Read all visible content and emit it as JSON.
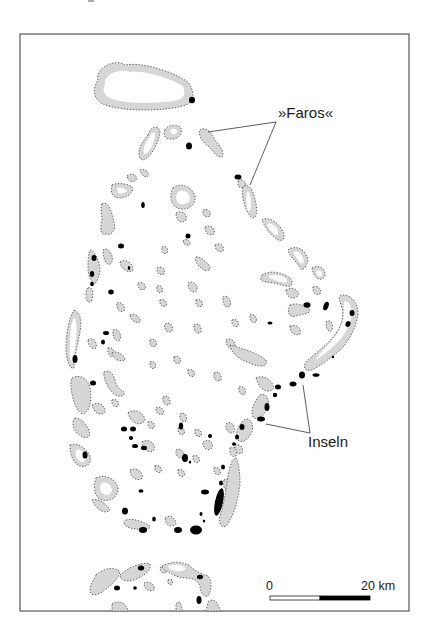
{
  "map": {
    "labels": {
      "faros": "»Faros«",
      "inseln": "Inseln"
    },
    "scale_bar": {
      "start_label": "0",
      "end_label": "20 km"
    },
    "colors": {
      "reef_fill": "#d6d6d6",
      "reef_outline": "#555555",
      "island": "#000000",
      "lagoon": "#ffffff",
      "frame": "#555555"
    },
    "frame": {
      "x": 20,
      "y": 34,
      "w": 389,
      "h": 577
    },
    "leaders": {
      "faros": [
        [
          276,
          122,
          208,
          132
        ],
        [
          276,
          122,
          250,
          185
        ]
      ],
      "inseln": [
        [
          310,
          433,
          266,
          424
        ],
        [
          310,
          433,
          303,
          385
        ]
      ]
    },
    "reefs": [
      {
        "d": "M98,80 C95,68 115,58 125,65 C140,62 170,70 188,82 C195,92 194,100 188,104 C170,112 120,112 103,104 C92,98 93,88 98,80 Z",
        "lagoon": "M105,84 C104,74 120,68 130,72 C145,70 170,78 183,86 C186,94 184,98 178,100 C160,104 122,104 110,98 C102,94 103,88 105,84 Z"
      },
      {
        "d": "M148,135 C150,126 160,124 160,133 C158,145 150,158 143,160 C136,158 138,146 148,135 Z",
        "lagoon": "M149,138 C152,131 156,131 155,137 C153,146 149,153 145,154 C142,151 144,145 149,138 Z"
      },
      {
        "d": "M165,130 C168,124 178,124 181,128 C183,136 176,140 170,139 C165,139 163,135 165,130 Z",
        "lagoon": "M170,131 C172,128 176,128 177,131 C177,134 174,135 172,134 Z"
      },
      {
        "d": "M200,130 C205,126 212,132 215,140 C220,146 225,152 222,157 C217,158 212,150 208,146 C202,142 198,135 200,130 Z"
      },
      {
        "d": "M238,180 C242,178 246,182 246,186 C244,188 240,188 238,186 Z"
      },
      {
        "d": "M244,186 C248,184 252,188 254,196 C257,205 258,215 254,218 C249,218 245,208 243,198 C242,192 242,188 244,186 Z",
        "lagoon": "M247,192 C249,191 251,196 251,203 C251,209 250,212 248,211 C246,207 246,198 247,192 Z"
      },
      {
        "d": "M127,176 C132,172 138,175 136,180 C133,183 128,182 127,176 Z"
      },
      {
        "d": "M140,170 C144,168 150,172 148,176 C146,178 142,177 140,170 Z"
      },
      {
        "d": "M112,185 C118,182 130,184 133,188 C132,195 125,198 118,198 C112,197 110,192 112,185 Z",
        "lagoon": "M117,188 C121,187 126,189 127,191 C125,193 121,194 118,193 Z"
      },
      {
        "d": "M102,204 C108,200 112,212 114,222 C116,230 112,236 106,234 C100,236 100,228 102,220 C102,214 100,208 102,204 Z"
      },
      {
        "d": "M173,188 C180,182 192,186 195,196 C196,206 188,210 180,209 C172,207 168,198 173,188 Z",
        "lagoon": "M178,192 C183,189 189,192 190,198 C190,203 185,205 180,204 C176,202 175,196 178,192 Z"
      },
      {
        "d": "M176,213 C182,210 188,214 186,220 C182,224 176,222 176,213 Z"
      },
      {
        "d": "M203,210 C207,208 212,212 210,216 C206,218 202,216 203,210 Z"
      },
      {
        "d": "M205,227 C210,224 216,228 214,234 C210,236 205,234 205,227 Z"
      },
      {
        "d": "M215,245 C220,242 225,246 223,251 C219,253 215,250 215,245 Z"
      },
      {
        "d": "M183,241 C186,238 190,240 190,244 C188,246 184,246 183,241 Z"
      },
      {
        "d": "M196,257 C200,256 205,261 209,265 C212,269 208,272 204,270 C199,267 194,262 196,257 Z"
      },
      {
        "d": "M162,247 C166,245 169,249 167,253 C164,255 161,252 162,247 Z"
      },
      {
        "d": "M157,268 C161,265 166,269 164,274 C160,276 156,273 157,268 Z"
      },
      {
        "d": "M138,283 C142,281 147,285 145,289 C141,291 137,288 138,283 Z"
      },
      {
        "d": "M157,286 C160,284 164,288 162,292 C159,294 156,291 157,286 Z"
      },
      {
        "d": "M160,300 C164,298 168,302 166,306 C162,308 159,304 160,300 Z"
      },
      {
        "d": "M188,283 C192,280 198,284 197,290 C194,294 188,292 188,283 Z"
      },
      {
        "d": "M196,300 C200,298 204,302 202,306 C198,308 195,305 196,300 Z"
      },
      {
        "d": "M194,325 C198,322 202,326 201,332 C198,335 193,332 194,325 Z"
      },
      {
        "d": "M223,297 C227,294 232,300 230,306 C227,309 222,306 223,297 Z"
      },
      {
        "d": "M232,320 C236,318 240,322 238,326 C235,328 231,325 232,320 Z"
      },
      {
        "d": "M250,315 C254,313 258,318 256,322 C252,324 249,320 250,315 Z"
      },
      {
        "d": "M226,340 C230,337 236,341 235,347 C232,351 226,348 226,340 Z"
      },
      {
        "d": "M165,324 C170,321 174,326 172,331 C168,334 163,330 165,324 Z"
      },
      {
        "d": "M150,340 C154,337 158,342 156,346 C152,348 149,345 150,340 Z"
      },
      {
        "d": "M174,357 C178,354 182,359 180,363 C176,365 173,361 174,357 Z"
      },
      {
        "d": "M150,362 C154,360 157,364 155,368 C152,370 149,367 150,362 Z"
      },
      {
        "d": "M214,373 C218,370 222,374 221,380 C217,383 213,379 214,373 Z"
      },
      {
        "d": "M188,370 C192,368 196,372 194,376 C190,378 187,374 188,370 Z"
      },
      {
        "d": "M239,387 C243,385 247,390 245,394 C241,396 238,392 239,387 Z"
      },
      {
        "d": "M163,397 C167,394 171,398 170,404 C166,407 162,403 163,397 Z"
      },
      {
        "d": "M180,414 C184,411 188,416 186,421 C182,423 179,419 180,414 Z"
      },
      {
        "d": "M226,424 C230,420 236,425 234,432 C230,435 225,431 226,424 Z"
      },
      {
        "d": "M235,445 C240,443 244,448 242,453 C237,455 234,451 235,445 Z"
      },
      {
        "d": "M130,315 C134,312 142,318 140,322 C136,324 130,320 130,315 Z"
      },
      {
        "d": "M120,262 C126,258 134,264 133,270 C130,274 121,270 120,262 Z"
      },
      {
        "d": "M103,250 C108,246 114,255 112,262 C109,268 103,262 103,250 Z"
      },
      {
        "d": "M90,250 C94,250 98,258 100,268 C100,274 98,280 95,284 C91,282 88,276 88,268 C88,262 88,256 90,250 Z"
      },
      {
        "d": "M88,288 C92,286 94,292 92,300 C90,304 86,302 86,296 C86,292 86,290 88,288 Z"
      },
      {
        "d": "M74,310 C80,312 82,320 80,332 C78,344 74,356 74,368 C70,370 66,360 66,348 C66,332 70,316 74,310 Z",
        "lagoon": "M74,318 C77,320 77,330 76,340 C75,350 73,358 72,362 C70,360 69,352 70,342 C70,330 72,320 74,318 Z"
      },
      {
        "d": "M88,340 C92,336 98,342 96,348 C92,350 88,346 88,340 Z"
      },
      {
        "d": "M113,330 C118,328 122,334 120,340 C116,342 112,338 113,330 Z"
      },
      {
        "d": "M108,348 C112,346 116,352 114,356 C110,358 107,354 108,348 Z"
      },
      {
        "d": "M117,303 C121,301 126,306 124,311 C120,313 116,309 117,303 Z"
      },
      {
        "d": "M112,353 C116,350 124,354 125,360 C120,362 113,360 112,353 Z"
      },
      {
        "d": "M72,378 C80,374 88,378 90,388 C92,400 90,410 84,414 C78,414 74,404 72,394 C71,388 70,382 72,378 Z"
      },
      {
        "d": "M104,372 C108,369 114,374 115,380 C116,386 120,390 124,392 C126,396 120,398 114,394 C108,388 103,380 104,372 Z"
      },
      {
        "d": "M112,400 C116,398 120,402 118,406 C115,408 111,405 112,400 Z"
      },
      {
        "d": "M75,418 C82,418 88,426 90,434 C88,440 82,438 76,432 C72,426 72,420 75,418 Z"
      },
      {
        "d": "M70,445 C78,442 86,448 90,456 C92,464 86,468 80,466 C74,464 70,456 70,445 Z",
        "lagoon": "M76,450 C80,448 84,452 86,458 C86,462 82,463 79,461 C76,458 75,454 76,450 Z"
      },
      {
        "d": "M92,405 C98,401 106,405 105,412 C102,416 94,414 92,405 Z"
      },
      {
        "d": "M128,413 C134,408 144,412 145,420 C142,426 132,426 128,413 Z"
      },
      {
        "d": "M142,442 C148,438 156,443 154,450 C150,454 142,450 142,442 Z"
      },
      {
        "d": "M148,422 C152,420 156,424 154,428 C150,430 147,426 148,422 Z"
      },
      {
        "d": "M156,408 C160,405 165,410 163,414 C159,416 155,412 156,408 Z"
      },
      {
        "d": "M178,428 C182,426 186,430 184,434 C180,436 177,432 178,428 Z"
      },
      {
        "d": "M195,430 C199,428 203,432 201,436 C197,438 194,434 195,430 Z"
      },
      {
        "d": "M176,450 C180,447 185,452 184,457 C180,460 175,456 176,450 Z"
      },
      {
        "d": "M193,456 C197,454 201,458 199,462 C195,464 192,460 193,456 Z"
      },
      {
        "d": "M155,466 C159,464 163,468 161,472 C157,474 154,470 155,466 Z"
      },
      {
        "d": "M130,470 C136,467 144,472 142,478 C138,482 130,478 130,470 Z"
      },
      {
        "d": "M96,478 C104,474 116,478 118,488 C118,498 110,502 102,500 C96,498 92,490 96,478 Z",
        "lagoon": "M102,483 C106,481 111,484 112,490 C111,495 106,496 103,494 C100,492 99,487 102,483 Z"
      },
      {
        "d": "M92,500 C100,498 106,504 110,510 C106,514 98,512 92,500 Z"
      },
      {
        "d": "M126,520 C134,518 144,522 150,526 C152,530 140,530 130,528 C124,526 122,522 126,520 Z"
      },
      {
        "d": "M165,518 C170,514 176,518 176,524 C172,528 165,526 165,518 Z"
      },
      {
        "d": "M178,470 C182,468 186,472 184,476 C180,478 177,474 178,470 Z"
      },
      {
        "d": "M224,480 C228,476 234,482 232,490 C228,494 222,490 224,480 Z"
      },
      {
        "d": "M214,468 C218,466 222,470 220,474 C216,476 213,472 214,468 Z"
      },
      {
        "d": "M203,442 C208,438 214,442 212,448 C208,452 202,448 203,442 Z"
      },
      {
        "d": "M230,448 C234,446 238,450 236,456 C232,458 229,454 230,448 Z"
      },
      {
        "d": "M236,458 C238,460 240,470 240,484 C238,500 234,516 226,526 C222,528 218,524 220,516 C224,504 226,490 228,476 C230,466 232,458 236,458 Z"
      },
      {
        "d": "M230,345 C240,348 256,352 266,360 C268,366 262,368 252,364 C242,360 232,356 230,345 Z"
      },
      {
        "d": "M256,378 C264,374 272,380 274,388 C270,394 260,392 256,378 Z"
      },
      {
        "d": "M260,395 C266,392 270,400 268,408 C264,416 258,420 254,418 C250,414 252,404 260,395 Z"
      },
      {
        "d": "M244,420 C250,416 254,424 252,432 C248,440 242,444 238,440 C234,434 238,426 244,420 Z"
      },
      {
        "d": "M262,275 C270,270 282,272 290,278 C294,282 292,288 286,286 C278,284 270,282 264,282 C260,280 260,278 262,275 Z",
        "lagoon": "M268,276 C274,274 282,275 287,279 C288,282 285,283 281,282 C275,280 270,279 268,276 Z"
      },
      {
        "d": "M262,220 C268,216 278,222 282,230 C286,236 284,242 278,240 C272,236 266,230 262,220 Z",
        "lagoon": "M267,224 C271,222 276,226 278,231 C279,235 277,236 274,234 C270,231 268,228 267,224 Z"
      },
      {
        "d": "M288,250 C296,244 306,250 308,260 C306,268 302,272 300,268 C296,260 290,258 288,250 Z",
        "lagoon": "M294,252 C298,250 303,255 304,261 C303,265 300,264 298,260 C296,257 294,255 294,252 Z"
      },
      {
        "d": "M312,268 C318,264 326,268 325,276 C322,282 314,280 312,268 Z",
        "lagoon": "M316,271 C319,269 322,271 322,275 C320,278 317,277 316,271 Z"
      },
      {
        "d": "M313,287 C318,285 322,289 320,294 C316,296 312,292 313,287 Z"
      },
      {
        "d": "M286,290 C292,286 300,290 298,296 C294,300 286,298 286,290 Z"
      },
      {
        "d": "M290,305 C296,302 308,306 310,310 C310,314 302,314 296,316 C290,318 286,314 290,305 Z"
      },
      {
        "d": "M290,326 C296,324 302,328 300,334 C296,336 290,334 290,326 Z"
      },
      {
        "d": "M326,322 C330,318 334,324 332,330 C330,334 326,330 326,322 Z"
      },
      {
        "d": "M340,296 C348,292 356,300 358,310 C358,322 352,336 344,346 C334,356 320,366 312,370 C306,372 302,368 306,362 C314,354 326,346 334,336 C342,326 344,316 342,308 C340,302 338,298 340,296 Z",
        "lagoon": "M344,302 C348,300 352,306 352,314 C350,326 344,336 336,344 C330,350 322,356 316,360 C318,354 326,348 332,340 C340,332 344,320 344,310 C344,306 344,304 344,302 Z"
      },
      {
        "d": "M96,575 C104,568 114,566 120,572 C118,580 110,586 102,592 C96,596 90,596 90,590 C90,584 94,580 96,575 Z"
      },
      {
        "d": "M120,575 C130,566 142,562 150,564 C152,570 144,576 134,580 C126,582 120,580 120,575 Z"
      },
      {
        "d": "M160,568 C162,564 168,566 166,572 C164,574 160,572 160,568 Z"
      },
      {
        "d": "M162,566 C170,562 180,560 190,566 C196,572 202,574 208,576 C212,580 212,590 208,596 C204,598 200,592 200,586 C198,580 192,578 186,578 C178,578 172,574 168,572 C164,570 162,568 162,566 Z",
        "lagoon": "M168,566 C174,564 180,564 186,568 C184,572 178,572 172,570 C170,569 168,568 168,566 Z"
      },
      {
        "d": "M144,583 C150,580 156,586 154,590 C150,592 144,590 144,583 Z"
      },
      {
        "d": "M168,580 C170,578 174,580 172,584 C170,586 167,584 168,580 Z"
      },
      {
        "d": "M112,604 C118,600 126,602 128,611 L112,611 Z"
      },
      {
        "d": "M176,604 C178,600 182,602 182,611 L176,611 Z"
      },
      {
        "d": "M208,602 C212,598 218,600 220,611 L206,611 Z"
      }
    ],
    "islands": [
      {
        "cx": 192,
        "cy": 100,
        "rx": 3,
        "ry": 3.2
      },
      {
        "cx": 189,
        "cy": 146,
        "rx": 3,
        "ry": 3.5
      },
      {
        "cx": 238,
        "cy": 177,
        "rx": 3.5,
        "ry": 2.5
      },
      {
        "cx": 143,
        "cy": 205,
        "rx": 1.8,
        "ry": 3
      },
      {
        "cx": 121,
        "cy": 246,
        "rx": 3,
        "ry": 2.5
      },
      {
        "cx": 129,
        "cy": 268,
        "rx": 1.2,
        "ry": 2
      },
      {
        "cx": 94,
        "cy": 258,
        "rx": 2.5,
        "ry": 3
      },
      {
        "cx": 92,
        "cy": 274,
        "rx": 2.2,
        "ry": 3
      },
      {
        "cx": 92,
        "cy": 284,
        "rx": 1.8,
        "ry": 2.2
      },
      {
        "cx": 111,
        "cy": 292,
        "rx": 2.8,
        "ry": 2.5
      },
      {
        "cx": 188,
        "cy": 236,
        "rx": 2.5,
        "ry": 2.5
      },
      {
        "cx": 75,
        "cy": 359,
        "rx": 2.5,
        "ry": 4
      },
      {
        "cx": 93,
        "cy": 383,
        "rx": 3,
        "ry": 2.5
      },
      {
        "cx": 106,
        "cy": 333,
        "rx": 3,
        "ry": 2
      },
      {
        "cx": 103,
        "cy": 342,
        "rx": 2,
        "ry": 2.5
      },
      {
        "cx": 85,
        "cy": 455,
        "rx": 2.5,
        "ry": 3.5
      },
      {
        "cx": 124,
        "cy": 429,
        "rx": 3,
        "ry": 2.5
      },
      {
        "cx": 133,
        "cy": 429,
        "rx": 3,
        "ry": 2.5
      },
      {
        "cx": 131,
        "cy": 438,
        "rx": 2.2,
        "ry": 2
      },
      {
        "cx": 135,
        "cy": 446,
        "rx": 3,
        "ry": 2
      },
      {
        "cx": 144,
        "cy": 448,
        "rx": 3,
        "ry": 2.2
      },
      {
        "cx": 181,
        "cy": 426,
        "rx": 2.2,
        "ry": 3.5
      },
      {
        "cx": 185,
        "cy": 458,
        "rx": 3,
        "ry": 4
      },
      {
        "cx": 190,
        "cy": 462,
        "rx": 1.2,
        "ry": 1.5
      },
      {
        "cx": 210,
        "cy": 436,
        "rx": 2,
        "ry": 2
      },
      {
        "cx": 141,
        "cy": 491,
        "rx": 2.5,
        "ry": 1.8
      },
      {
        "cx": 125,
        "cy": 511,
        "rx": 3,
        "ry": 3.5
      },
      {
        "cx": 154,
        "cy": 519,
        "rx": 1.8,
        "ry": 2.5
      },
      {
        "cx": 143,
        "cy": 530,
        "rx": 4,
        "ry": 3
      },
      {
        "cx": 178,
        "cy": 530,
        "rx": 4,
        "ry": 3
      },
      {
        "cx": 196,
        "cy": 530,
        "rx": 6,
        "ry": 4.5
      },
      {
        "cx": 205,
        "cy": 492,
        "rx": 4,
        "ry": 2.5
      },
      {
        "cx": 201,
        "cy": 514,
        "rx": 1.5,
        "ry": 2
      },
      {
        "cx": 204,
        "cy": 521,
        "rx": 1.2,
        "ry": 1.5
      },
      {
        "cx": 219,
        "cy": 502,
        "rx": 4,
        "ry": 14,
        "rot": 12
      },
      {
        "cx": 221,
        "cy": 483,
        "rx": 2,
        "ry": 2.5
      },
      {
        "cx": 223,
        "cy": 467,
        "rx": 2,
        "ry": 2.5
      },
      {
        "cx": 270,
        "cy": 323,
        "rx": 2.5,
        "ry": 1.5
      },
      {
        "cx": 307,
        "cy": 305,
        "rx": 3.5,
        "ry": 2.8
      },
      {
        "cx": 326,
        "cy": 306,
        "rx": 2.5,
        "ry": 4.5,
        "rot": 20
      },
      {
        "cx": 352,
        "cy": 313,
        "rx": 2.5,
        "ry": 3
      },
      {
        "cx": 348,
        "cy": 324,
        "rx": 2.5,
        "ry": 3,
        "rot": 20
      },
      {
        "cx": 333,
        "cy": 357,
        "rx": 1.2,
        "ry": 1.2
      },
      {
        "cx": 302,
        "cy": 375,
        "rx": 3,
        "ry": 3.5
      },
      {
        "cx": 293,
        "cy": 384,
        "rx": 3.5,
        "ry": 2.5
      },
      {
        "cx": 278,
        "cy": 387,
        "rx": 3,
        "ry": 2.5
      },
      {
        "cx": 275,
        "cy": 395,
        "rx": 2.2,
        "ry": 2.2
      },
      {
        "cx": 267,
        "cy": 407,
        "rx": 2.5,
        "ry": 4
      },
      {
        "cx": 261,
        "cy": 419,
        "rx": 4,
        "ry": 2.5
      },
      {
        "cx": 242,
        "cy": 427,
        "rx": 2.5,
        "ry": 3
      },
      {
        "cx": 237,
        "cy": 437,
        "rx": 2,
        "ry": 2.5
      },
      {
        "cx": 234,
        "cy": 444,
        "rx": 2,
        "ry": 1.8
      },
      {
        "cx": 316,
        "cy": 375,
        "rx": 3.5,
        "ry": 1.8
      },
      {
        "cx": 141,
        "cy": 568,
        "rx": 3.2,
        "ry": 2.5
      },
      {
        "cx": 117,
        "cy": 588,
        "rx": 3,
        "ry": 2.5
      },
      {
        "cx": 135,
        "cy": 588,
        "rx": 1.8,
        "ry": 1.8
      },
      {
        "cx": 200,
        "cy": 577,
        "rx": 3,
        "ry": 2.2
      },
      {
        "cx": 199,
        "cy": 600,
        "rx": 2.5,
        "ry": 4
      }
    ]
  }
}
